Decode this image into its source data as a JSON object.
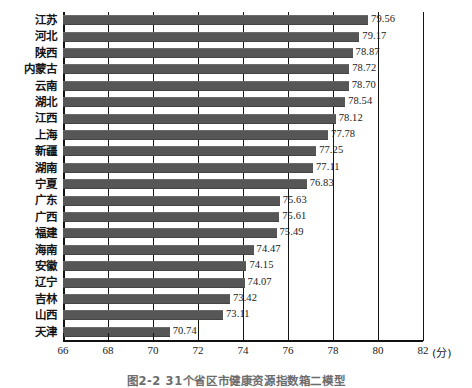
{
  "chart_data": {
    "type": "bar",
    "orientation": "horizontal",
    "title": "",
    "xlabel": "(分)",
    "ylabel": "",
    "xlim": [
      66,
      82
    ],
    "xticks": [
      66,
      68,
      70,
      72,
      74,
      76,
      78,
      80,
      82
    ],
    "grid": "vertical",
    "legend": "none",
    "bar_color": "#565656",
    "categories": [
      "江苏",
      "河北",
      "陕西",
      "内蒙古",
      "云南",
      "湖北",
      "江西",
      "上海",
      "新疆",
      "湖南",
      "宁夏",
      "广东",
      "广西",
      "福建",
      "海南",
      "安徽",
      "辽宁",
      "吉林",
      "山西",
      "天津"
    ],
    "values": [
      79.56,
      79.17,
      78.87,
      78.72,
      78.7,
      78.54,
      78.12,
      77.78,
      77.25,
      77.11,
      76.83,
      75.63,
      75.61,
      75.49,
      74.47,
      74.15,
      74.07,
      73.42,
      73.11,
      70.74
    ],
    "value_labels": [
      "79.56",
      "79.17",
      "78.87",
      "78.72",
      "78.70",
      "78.54",
      "78.12",
      "77.78",
      "77.25",
      "77.11",
      "76.83",
      "75.63",
      "75.61",
      "75.49",
      "74.47",
      "74.15",
      "74.07",
      "73.42",
      "73.11",
      "70.74"
    ]
  },
  "caption": {
    "text": "图2-2 31个省区市健康资源指数箱二模型"
  },
  "axis": {
    "unit_label": "(分)"
  }
}
